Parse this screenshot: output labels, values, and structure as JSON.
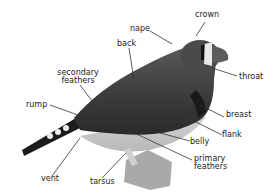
{
  "diagram": {
    "labels": {
      "crown": "crown",
      "nape": "nape",
      "back": "back",
      "throat": "throat",
      "secondary_feathers_1": "secondary",
      "secondary_feathers_2": "feathers",
      "rump": "rump",
      "breast": "breast",
      "flank": "flank",
      "belly": "belly",
      "primary_feathers_1": "primary",
      "primary_feathers_2": "feathers",
      "vent": "vent",
      "tarsus": "tarsus"
    },
    "colors": {
      "line": "#333333",
      "text": "#222222"
    }
  }
}
